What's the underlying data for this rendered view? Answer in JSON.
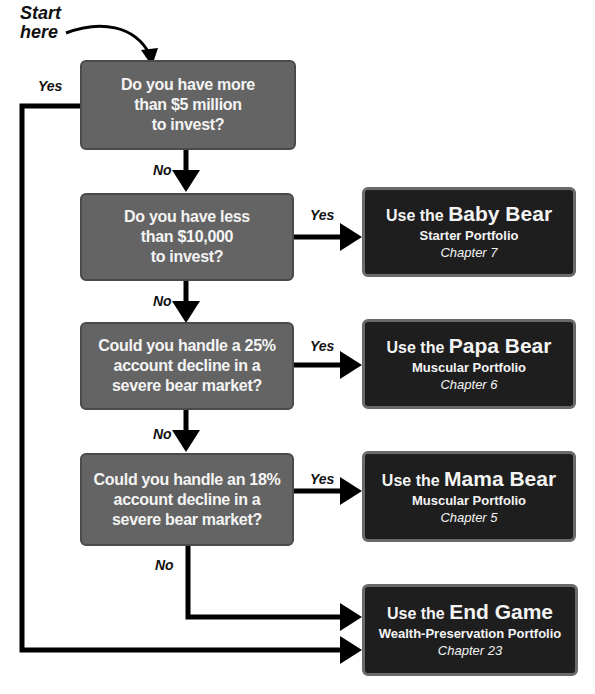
{
  "start_label": {
    "line1": "Start",
    "line2": "here"
  },
  "questions": [
    {
      "id": "q1",
      "lines": [
        "Do you have more",
        "than $5 million",
        "to invest?"
      ]
    },
    {
      "id": "q2",
      "lines": [
        "Do you have less",
        "than $10,000",
        "to invest?"
      ]
    },
    {
      "id": "q3",
      "lines": [
        "Could you handle a 25%",
        "account decline in a",
        "severe bear market?"
      ]
    },
    {
      "id": "q4",
      "lines": [
        "Could you handle an 18%",
        "account decline in a",
        "severe bear market?"
      ]
    }
  ],
  "results": [
    {
      "id": "baby",
      "prefix": "Use the ",
      "name": "Baby Bear",
      "type": "Starter Portfolio",
      "chapter": "Chapter 7"
    },
    {
      "id": "papa",
      "prefix": "Use the ",
      "name": "Papa Bear",
      "type": "Muscular Portfolio",
      "chapter": "Chapter 6"
    },
    {
      "id": "mama",
      "prefix": "Use the ",
      "name": "Mama Bear",
      "type": "Muscular Portfolio",
      "chapter": "Chapter 5"
    },
    {
      "id": "endgame",
      "prefix": "Use the ",
      "name": "End Game",
      "type": "Wealth-Preservation Portfolio",
      "chapter": "Chapter 23"
    }
  ],
  "edge_labels": {
    "yes": "Yes",
    "no": "No"
  },
  "colors": {
    "question_fill": "#646464",
    "result_fill": "#1e1e1e",
    "line": "#000000"
  }
}
